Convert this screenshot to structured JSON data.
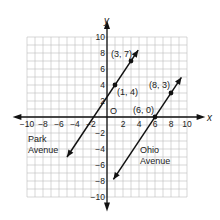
{
  "chart_data": {
    "type": "line",
    "title": "",
    "xlabel": "x",
    "ylabel": "y",
    "xlim": [
      -10,
      10
    ],
    "ylim": [
      -10,
      10
    ],
    "grid": true,
    "origin_label": "O",
    "x_ticks": [
      -10,
      -8,
      -6,
      -4,
      -2,
      2,
      4,
      6,
      8,
      10
    ],
    "y_ticks": [
      -10,
      -8,
      -6,
      -4,
      -2,
      2,
      4,
      6,
      8,
      10
    ],
    "series": [
      {
        "name": "Park Avenue",
        "equation": "y = 1.5x + 2.5",
        "points": [
          {
            "x": 1,
            "y": 4,
            "label": "(1, 4)"
          },
          {
            "x": 3,
            "y": 7,
            "label": "(3, 7)"
          }
        ]
      },
      {
        "name": "Ohio Avenue",
        "equation": "y = 1.5x - 9",
        "points": [
          {
            "x": 6,
            "y": 0,
            "label": "(6, 0)"
          },
          {
            "x": 8,
            "y": 3,
            "label": "(8, 3)"
          }
        ]
      }
    ]
  },
  "labels": {
    "park_line1": "Park",
    "park_line2": "Avenue",
    "ohio_line1": "Ohio",
    "ohio_line2": "Avenue"
  },
  "colors": {
    "grid": "#bdbdbd",
    "axis": "#111111",
    "line": "#111111"
  }
}
